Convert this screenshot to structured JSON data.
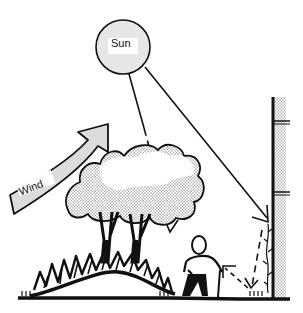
{
  "diagram": {
    "labels": {
      "sun": "Sun",
      "wind": "Wind"
    },
    "elements": [
      "sun",
      "sun-rays",
      "wind-arrow",
      "tree",
      "shrubs-on-mound",
      "person-with-cane",
      "wall",
      "wall-vine",
      "reflected-ray",
      "ground"
    ],
    "colors": {
      "ink": "#111111",
      "sun_fill": "#e6e6e6",
      "arrow_fill": "#dcdcdc",
      "stipple": "#9a9a9a",
      "background": "#ffffff"
    }
  }
}
